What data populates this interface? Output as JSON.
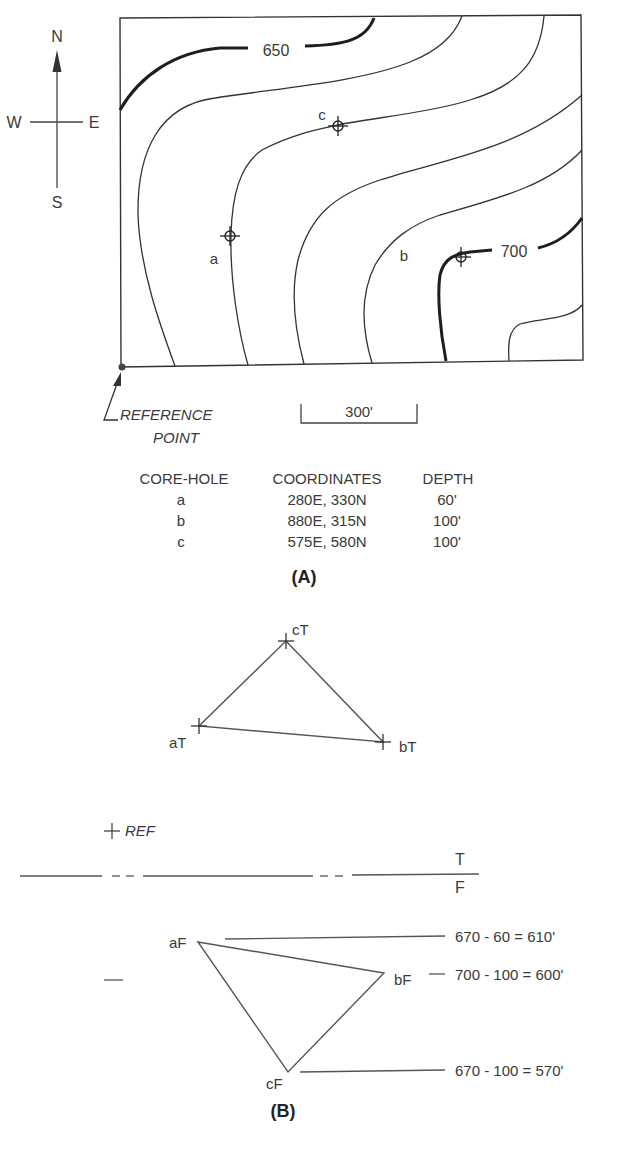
{
  "compass": {
    "north": "N",
    "south": "S",
    "east": "E",
    "west": "W"
  },
  "panel_a": {
    "contour_labels": {
      "c650": "650",
      "c700": "700"
    },
    "core_hole_labels": {
      "a": "a",
      "b": "b",
      "c": "c"
    },
    "reference_point": {
      "line1": "REFERENCE",
      "line2": "POINT"
    },
    "scale_bar": "300'",
    "table": {
      "headers": [
        "CORE-HOLE",
        "COORDINATES",
        "DEPTH"
      ],
      "rows": [
        {
          "hole": "a",
          "coords": "280E, 330N",
          "depth": "60'"
        },
        {
          "hole": "b",
          "coords": "880E, 315N",
          "depth": "100'"
        },
        {
          "hole": "c",
          "coords": "575E, 580N",
          "depth": "100'"
        }
      ]
    },
    "caption": "(A)"
  },
  "panel_b": {
    "top_points": {
      "a": "aT",
      "b": "bT",
      "c": "cT"
    },
    "ref_label": "REF",
    "fold_labels": {
      "top": "T",
      "bottom": "F"
    },
    "front_points": {
      "a": "aF",
      "b": "bF",
      "c": "cF"
    },
    "elevations": {
      "a": "670 - 60 = 610'",
      "b": "700 - 100 = 600'",
      "c": "670 - 100 = 570'"
    },
    "caption": "(B)"
  }
}
